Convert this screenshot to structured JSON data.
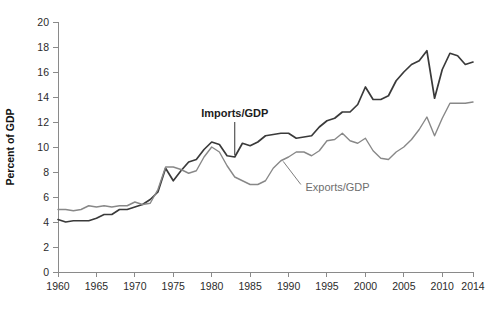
{
  "chart_data": {
    "type": "line",
    "title": "",
    "xlabel": "",
    "ylabel": "Percent of GDP",
    "xlim": [
      1960,
      2014
    ],
    "ylim": [
      0,
      20
    ],
    "grid": false,
    "legend_position": "inline-annotations",
    "xticks": [
      1960,
      1965,
      1970,
      1975,
      1980,
      1985,
      1990,
      1995,
      2000,
      2005,
      2010,
      2014
    ],
    "xtick_labels": [
      "1960",
      "1965",
      "1970",
      "1975",
      "1980",
      "1985",
      "1990",
      "1995",
      "2000",
      "2005",
      "2010",
      "2014"
    ],
    "yticks": [
      0,
      2,
      4,
      6,
      8,
      10,
      12,
      14,
      16,
      18,
      20
    ],
    "ytick_labels": [
      "0",
      "2",
      "4",
      "6",
      "8",
      "10",
      "12",
      "14",
      "16",
      "18",
      "20"
    ],
    "x": [
      1960,
      1961,
      1962,
      1963,
      1964,
      1965,
      1966,
      1967,
      1968,
      1969,
      1970,
      1971,
      1972,
      1973,
      1974,
      1975,
      1976,
      1977,
      1978,
      1979,
      1980,
      1981,
      1982,
      1983,
      1984,
      1985,
      1986,
      1987,
      1988,
      1989,
      1990,
      1991,
      1992,
      1993,
      1994,
      1995,
      1996,
      1997,
      1998,
      1999,
      2000,
      2001,
      2002,
      2003,
      2004,
      2005,
      2006,
      2007,
      2008,
      2009,
      2010,
      2011,
      2012,
      2013,
      2014
    ],
    "series": [
      {
        "name": "Imports/GDP",
        "color": "#3a3a3a",
        "width": 1.7,
        "values": [
          4.2,
          4.0,
          4.1,
          4.1,
          4.1,
          4.3,
          4.6,
          4.6,
          5.0,
          5.0,
          5.2,
          5.4,
          5.8,
          6.4,
          8.3,
          7.3,
          8.1,
          8.8,
          9.0,
          9.8,
          10.4,
          10.2,
          9.3,
          9.2,
          10.3,
          10.1,
          10.4,
          10.9,
          11.0,
          11.1,
          11.1,
          10.7,
          10.8,
          10.9,
          11.6,
          12.1,
          12.3,
          12.8,
          12.8,
          13.4,
          14.8,
          13.8,
          13.8,
          14.1,
          15.3,
          16.0,
          16.6,
          16.9,
          17.7,
          13.9,
          16.2,
          17.5,
          17.3,
          16.6,
          16.8
        ]
      },
      {
        "name": "Exports/GDP",
        "color": "#888888",
        "width": 1.4,
        "values": [
          5.0,
          5.0,
          4.9,
          5.0,
          5.3,
          5.2,
          5.3,
          5.2,
          5.3,
          5.3,
          5.6,
          5.4,
          5.5,
          6.6,
          8.4,
          8.4,
          8.2,
          7.9,
          8.1,
          9.2,
          10.0,
          9.6,
          8.5,
          7.6,
          7.3,
          7.0,
          7.0,
          7.3,
          8.3,
          8.9,
          9.2,
          9.6,
          9.6,
          9.3,
          9.7,
          10.5,
          10.6,
          11.1,
          10.5,
          10.3,
          10.7,
          9.7,
          9.1,
          9.0,
          9.6,
          10.0,
          10.6,
          11.4,
          12.4,
          10.9,
          12.3,
          13.5,
          13.5,
          13.5,
          13.6
        ]
      }
    ],
    "annotations": [
      {
        "text": "Imports/GDP",
        "style": "bold-dark",
        "label_x": 1983,
        "label_y": 12.4,
        "leader_from_x": 1983,
        "leader_from_y": 12.0,
        "leader_to_x": 1983,
        "leader_to_y": 9.35,
        "color": "#1c1c1c"
      },
      {
        "text": "Exports/GDP",
        "style": "plain-gray",
        "label_x": 1992.2,
        "label_y": 6.5,
        "leader_from_x": 1991.6,
        "leader_from_y": 7.0,
        "leader_to_x": 1989.3,
        "leader_to_y": 8.85,
        "color": "#6e6e6e"
      }
    ]
  },
  "axes": {
    "y_axis_title": "Percent of GDP",
    "axis_color": "#8a8a8a",
    "tick_text_color": "#2b2b2b"
  }
}
